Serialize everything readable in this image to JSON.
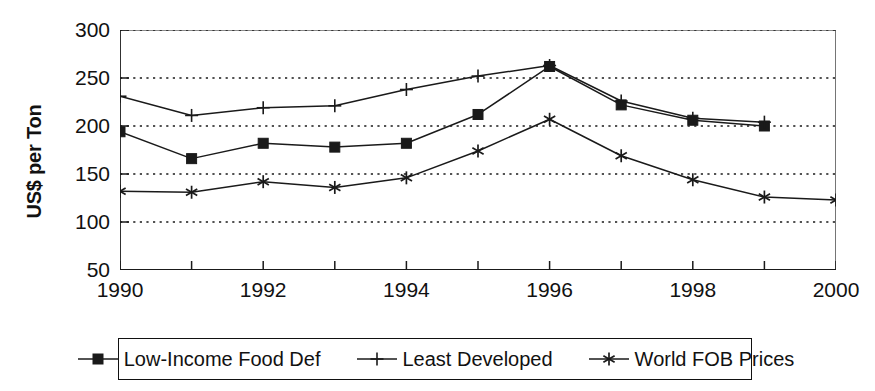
{
  "chart_data": {
    "type": "line",
    "title": "",
    "xlabel": "",
    "ylabel": "US$ per Ton",
    "x": [
      1990,
      1991,
      1992,
      1993,
      1994,
      1995,
      1996,
      1997,
      1998,
      1999,
      2000
    ],
    "xtick_labels": [
      "1990",
      "1992",
      "1994",
      "1996",
      "1998",
      "2000"
    ],
    "xtick_values": [
      1990,
      1992,
      1994,
      1996,
      1998,
      2000
    ],
    "ytick_labels": [
      "50",
      "100",
      "150",
      "200",
      "250",
      "300"
    ],
    "ytick_values": [
      50,
      100,
      150,
      200,
      250,
      300
    ],
    "ylim": [
      50,
      300
    ],
    "xlim": [
      1990,
      2000
    ],
    "grid": "horizontal-dotted",
    "legend_position": "bottom",
    "series": [
      {
        "name": "Low-Income Food Def",
        "marker": "square",
        "x": [
          1990,
          1991,
          1992,
          1993,
          1994,
          1995,
          1996,
          1997,
          1998,
          1999
        ],
        "values": [
          194,
          166,
          182,
          178,
          182,
          212,
          262,
          222,
          206,
          200
        ]
      },
      {
        "name": "Least Developed",
        "marker": "plus",
        "x": [
          1990,
          1991,
          1992,
          1993,
          1994,
          1995,
          1996,
          1997,
          1998,
          1999
        ],
        "values": [
          231,
          211,
          219,
          221,
          238,
          252,
          263,
          226,
          208,
          204
        ]
      },
      {
        "name": "World FOB Prices",
        "marker": "asterisk",
        "x": [
          1990,
          1991,
          1992,
          1993,
          1994,
          1995,
          1996,
          1997,
          1998,
          1999,
          2000
        ],
        "values": [
          132,
          131,
          142,
          136,
          146,
          174,
          207,
          169,
          144,
          126,
          123
        ]
      }
    ]
  },
  "legend": {
    "items": [
      {
        "label": "Low-Income Food Def",
        "marker": "square"
      },
      {
        "label": "Least Developed",
        "marker": "plus"
      },
      {
        "label": "World FOB Prices",
        "marker": "asterisk"
      }
    ]
  },
  "colors": {
    "line": "#1a1a1a",
    "grid": "#1a1a1a",
    "axis": "#1a1a1a",
    "background": "#ffffff"
  }
}
